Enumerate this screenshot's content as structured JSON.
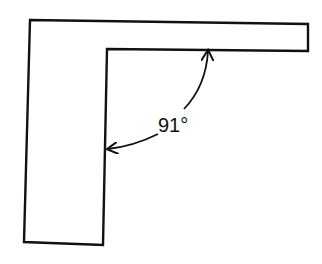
{
  "diagram": {
    "colors": {
      "stroke": "#111111",
      "background": "#ffffff"
    },
    "shape": {
      "name": "l-bracket",
      "points": [
        [
          30,
          20
        ],
        [
          308,
          24
        ],
        [
          308,
          51
        ],
        [
          107,
          49
        ],
        [
          103,
          245
        ],
        [
          24,
          242
        ]
      ]
    },
    "angle_annotation": {
      "label": "91°",
      "value_degrees": 91
    }
  }
}
